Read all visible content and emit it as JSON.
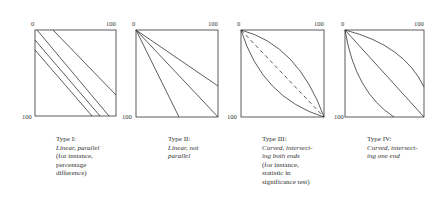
{
  "axis": {
    "min_label": "0",
    "max_label": "100"
  },
  "panels": [
    {
      "id": "type-i",
      "title": "Type I:",
      "desc": "Linear, parallel",
      "note": "(for instance, percentage difference)",
      "note_lines": [
        "(for instance,",
        "percentage",
        "difference)"
      ],
      "desc_lines": [
        "Linear, parallel"
      ]
    },
    {
      "id": "type-ii",
      "title": "Type II:",
      "desc": "Linear, not parallel",
      "desc_lines": [
        "Linear, not",
        "parallel"
      ],
      "note_lines": []
    },
    {
      "id": "type-iii",
      "title": "Type III:",
      "desc": "Curved, intersecting both ends",
      "desc_lines": [
        "Curved, intersect-",
        "ing both ends"
      ],
      "note": "(for instance, statistic in significance test)",
      "note_lines": [
        "(for instance,",
        "statistic in",
        "significance test)"
      ]
    },
    {
      "id": "type-iv",
      "title": "Type IV:",
      "desc": "Curved, intersecting one end",
      "desc_lines": [
        "Curved, intersect-",
        "ing one end"
      ],
      "note_lines": []
    }
  ]
}
